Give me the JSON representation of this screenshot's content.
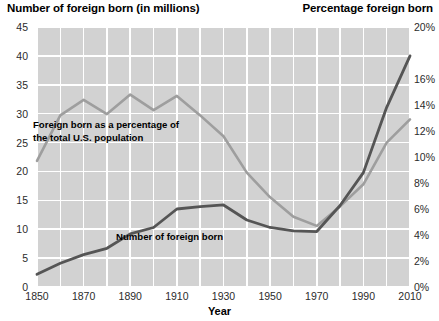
{
  "titles": {
    "left_axis_title": "Number of foreign born (in millions)",
    "right_axis_title": "Percentage foreign born",
    "x_axis_title": "Year"
  },
  "annotations": {
    "percentage_line_label_line1": "Foreign born as a percentage of",
    "percentage_line_label_line2": "the total U.S. population",
    "number_line_label": "Number of foreign born"
  },
  "axes": {
    "left_ticks": [
      "45",
      "40",
      "35",
      "30",
      "25",
      "20",
      "15",
      "10",
      "5",
      "0"
    ],
    "right_ticks": [
      "20%",
      "",
      "16%",
      "14%",
      "12%",
      "10%",
      "8%",
      "6%",
      "4%",
      "2%",
      "0%"
    ],
    "x_ticks": [
      "1850",
      "1870",
      "1890",
      "1910",
      "1930",
      "1950",
      "1970",
      "1990",
      "2010"
    ]
  },
  "colors": {
    "plot_background": "#d2d2d2",
    "gridline": "#ffffff",
    "number_series": "#555555",
    "percentage_series": "#9e9e9e",
    "text": "#000000"
  },
  "chart_data": {
    "type": "line",
    "xlabel": "Year",
    "ylabel": "Number of foreign born (in millions)",
    "y2label": "Percentage foreign born",
    "xlim": [
      1850,
      2010
    ],
    "ylim": [
      0,
      45
    ],
    "y2lim": [
      0,
      20
    ],
    "grid": true,
    "legend": "annotations-inline",
    "x": [
      1850,
      1860,
      1870,
      1880,
      1890,
      1900,
      1910,
      1920,
      1930,
      1940,
      1950,
      1960,
      1970,
      1980,
      1990,
      2000,
      2010
    ],
    "series": [
      {
        "name": "Number of foreign born",
        "axis": "left",
        "units": "millions",
        "color": "#555555",
        "values": [
          2.2,
          4.1,
          5.6,
          6.7,
          9.2,
          10.3,
          13.5,
          13.9,
          14.2,
          11.6,
          10.3,
          9.7,
          9.6,
          14.1,
          19.8,
          31.1,
          40.0
        ]
      },
      {
        "name": "Foreign born as a percentage of the total U.S. population",
        "axis": "right",
        "units": "percent",
        "color": "#9e9e9e",
        "values": [
          9.7,
          13.2,
          14.4,
          13.3,
          14.8,
          13.6,
          14.7,
          13.2,
          11.6,
          8.8,
          6.9,
          5.4,
          4.7,
          6.2,
          7.9,
          11.1,
          12.9
        ]
      }
    ]
  }
}
